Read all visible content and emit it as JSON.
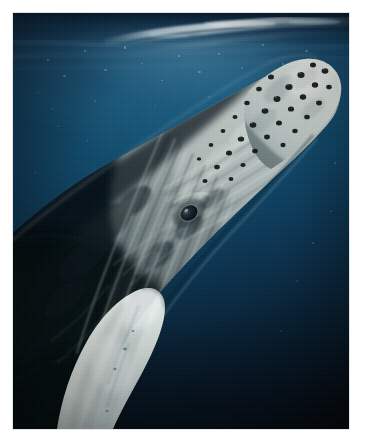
{
  "image": {
    "domain": "Natural-Image",
    "kind": "underwater-photograph",
    "subject": "humpback whale",
    "scientific_name": "Megaptera novaeangliae",
    "orientation": "portrait",
    "alt_text": "Underwater photograph of a humpback whale rising head-first toward the sunlit ocean surface, its knobbly rostrum and white pectoral fin visible against deep blue water.",
    "frame": {
      "mat_color": "#ffffff",
      "mat_width_px": 13,
      "photo_width_px": 336,
      "photo_height_px": 416,
      "edge_hairline_color": "#e2e6ea"
    },
    "palette": {
      "surface_highlight": "#cfe2ea",
      "upper_water": "#16567c",
      "mid_water": "#0f4a6c",
      "deep_water": "#061f33",
      "abyss": "#020c16",
      "whale_dark_skin": "#13222c",
      "whale_mid_skin": "#56646b",
      "whale_light_skin": "#b9c2c2",
      "whale_white": "#eef2f0",
      "tubercle_dark": "#0c1418",
      "eye_dark": "#08101a"
    },
    "regions": [
      {
        "name": "water-surface",
        "description": "Bright rippled surface band with silver wave crests across the top of the frame."
      },
      {
        "name": "sunlight-caustics",
        "description": "Scattered pale specks of refracted sunlight in the upper third of the water."
      },
      {
        "name": "whale-rostrum",
        "description": "Pale mottled snout tip at the upper right, studded with dark round tubercles."
      },
      {
        "name": "whale-eye",
        "description": "Small dark eye set in a crease of pale skin near the centre-left of the head."
      },
      {
        "name": "whale-throat-pleats",
        "description": "Long parallel ventral grooves running down the lower jaw toward the bottom of the frame."
      },
      {
        "name": "whale-pectoral-fin",
        "description": "Bright white pectoral fin entering from the lower left of the frame."
      },
      {
        "name": "whale-body-dark",
        "description": "Dark textured dorsal skin filling the left side of the frame."
      },
      {
        "name": "deep-water",
        "description": "Open navy-to-black water occupying the right and lower right of the frame."
      }
    ]
  }
}
